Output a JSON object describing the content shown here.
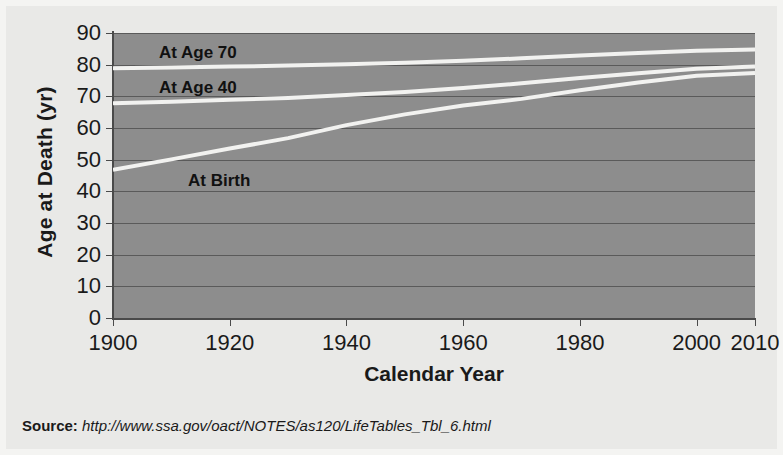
{
  "figure": {
    "background_color": "#e9e9e7",
    "plot_background_color": "#8d8d8d",
    "line_color": "#f2f2f0",
    "gridline_color": "#5a5a5a"
  },
  "axes": {
    "y_title": "Age at Death (yr)",
    "x_title": "Calendar Year",
    "y_ticks": [
      "90",
      "80",
      "70",
      "60",
      "50",
      "40",
      "30",
      "20",
      "10",
      "0"
    ],
    "x_ticks": [
      "1900",
      "1920",
      "1940",
      "1960",
      "1980",
      "2000",
      "2010"
    ]
  },
  "series_labels": {
    "at_age_70": "At Age 70",
    "at_age_40": "At Age 40",
    "at_birth": "At Birth"
  },
  "source": {
    "label": "Source:",
    "url": "http://www.ssa.gov/oact/NOTES/as120/LifeTables_Tbl_6.html"
  },
  "chart_data": {
    "type": "line",
    "title": "",
    "xlabel": "Calendar Year",
    "ylabel": "Age at Death (yr)",
    "xlim": [
      1900,
      2010
    ],
    "ylim": [
      0,
      90
    ],
    "xtick_values": [
      1900,
      1920,
      1940,
      1960,
      1980,
      2000,
      2010
    ],
    "ytick_values": [
      0,
      10,
      20,
      30,
      40,
      50,
      60,
      70,
      80,
      90
    ],
    "grid": true,
    "grid_axis": "y",
    "legend": "inline-labels",
    "legend_position": "in-plot",
    "x": [
      1900,
      1910,
      1920,
      1930,
      1940,
      1950,
      1960,
      1970,
      1980,
      1990,
      2000,
      2010
    ],
    "series": [
      {
        "name": "At Age 70",
        "label_position": "upper-left-inside",
        "values": [
          78.9,
          79.1,
          79.4,
          79.7,
          80.1,
          80.6,
          81.2,
          82.0,
          82.9,
          83.7,
          84.4,
          84.8
        ]
      },
      {
        "name": "At Age 40",
        "label_position": "mid-left-inside",
        "values": [
          67.8,
          68.3,
          68.9,
          69.5,
          70.4,
          71.4,
          72.6,
          74.1,
          75.8,
          77.3,
          78.7,
          79.4
        ]
      },
      {
        "name": "At Birth",
        "label_position": "lower-left-inside",
        "values": [
          46.8,
          50.1,
          53.5,
          56.8,
          60.9,
          64.3,
          67.1,
          69.2,
          71.9,
          74.4,
          76.5,
          77.4
        ]
      }
    ],
    "annotations": [
      {
        "text": "At Age 70",
        "x": 1908,
        "y": 86.5
      },
      {
        "text": "At Age 40",
        "x": 1908,
        "y": 75.5
      },
      {
        "text": "At Birth",
        "x": 1912,
        "y": 43.0
      }
    ],
    "source_note": "Source: http://www.ssa.gov/oact/NOTES/as120/LifeTables_Tbl_6.html"
  }
}
